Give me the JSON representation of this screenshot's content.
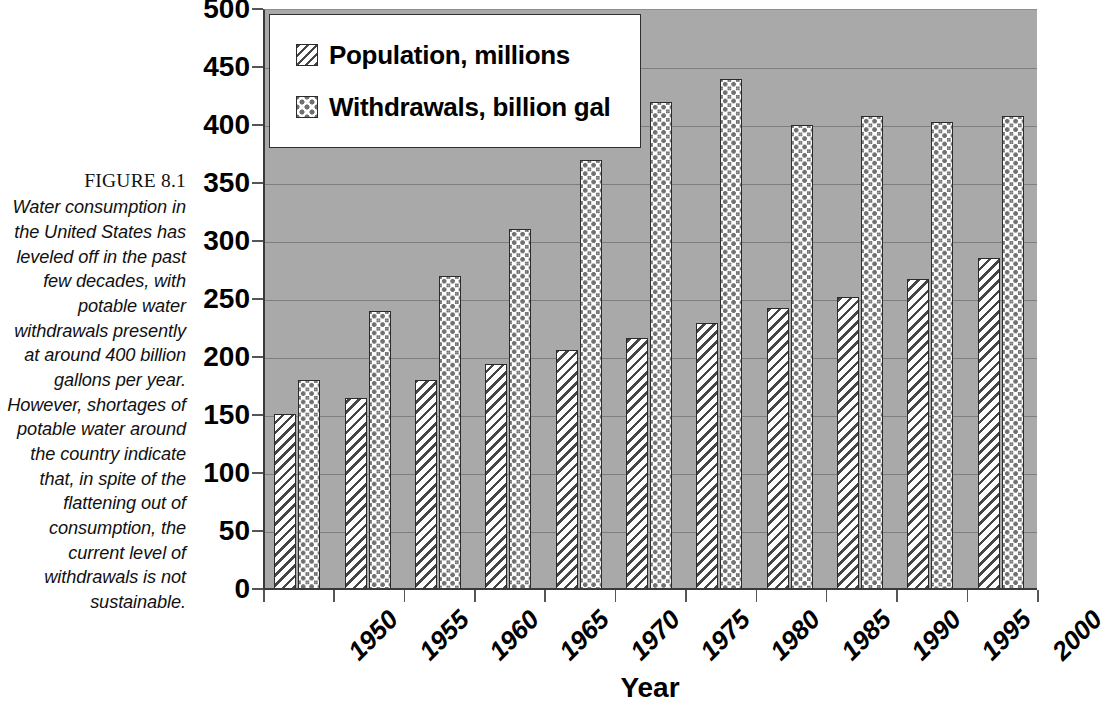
{
  "figure": {
    "number_label": "FIGURE 8.1",
    "caption": "Water consumption in the United States has leveled off in the past few decades, with potable water withdrawals presently at around 400 billion gallons per year. However, shortages of potable water around the country indicate that, in spite of the flattening out of consumption, the current level of withdrawals is not sustainable."
  },
  "chart_data": {
    "type": "bar",
    "title": "",
    "xlabel": "Year",
    "ylabel": "",
    "categories": [
      "1950",
      "1955",
      "1960",
      "1965",
      "1970",
      "1975",
      "1980",
      "1985",
      "1990",
      "1995",
      "2000"
    ],
    "series": [
      {
        "name": "Population, millions",
        "pattern": "diagonal-hatch",
        "values": [
          151,
          165,
          180,
          194,
          206,
          216,
          229,
          242,
          252,
          267,
          285
        ]
      },
      {
        "name": "Withdrawals, billion gal",
        "pattern": "checkered-dots",
        "values": [
          180,
          240,
          270,
          310,
          370,
          420,
          440,
          400,
          408,
          403,
          408
        ]
      }
    ],
    "ylim": [
      0,
      500
    ],
    "ytick_step": 50,
    "yticks": [
      "0",
      "50",
      "100",
      "150",
      "200",
      "250",
      "300",
      "350",
      "400",
      "450",
      "500"
    ],
    "grid": true,
    "legend_position": "top-left",
    "plot_background": "#a9a9a9",
    "bar_border_color": "#2b2b2b",
    "hatch_color": "#454545",
    "dot_color": "#707070"
  },
  "legend": {
    "entries": [
      {
        "label": "Population, millions",
        "swatch": "diagonal-hatch-swatch"
      },
      {
        "label": "Withdrawals, billion gal",
        "swatch": "checkered-dot-swatch"
      }
    ]
  }
}
